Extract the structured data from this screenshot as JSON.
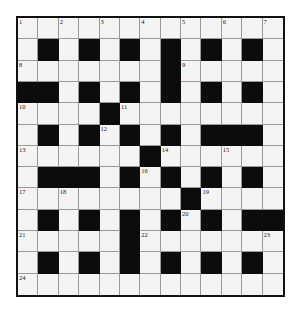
{
  "puzzle": {
    "rows": 13,
    "cols": 13,
    "colors": {
      "white_cell": "#f4f4f4",
      "black_cell": "#0c0c0c",
      "border": "#111111",
      "gridline": "#9a9a9a"
    },
    "black_cells": [
      [
        1,
        1
      ],
      [
        1,
        3
      ],
      [
        1,
        5
      ],
      [
        1,
        7
      ],
      [
        1,
        9
      ],
      [
        1,
        11
      ],
      [
        2,
        7
      ],
      [
        3,
        0
      ],
      [
        3,
        1
      ],
      [
        3,
        3
      ],
      [
        3,
        5
      ],
      [
        3,
        7
      ],
      [
        3,
        9
      ],
      [
        3,
        11
      ],
      [
        4,
        4
      ],
      [
        5,
        1
      ],
      [
        5,
        3
      ],
      [
        5,
        5
      ],
      [
        5,
        7
      ],
      [
        5,
        9
      ],
      [
        5,
        10
      ],
      [
        5,
        11
      ],
      [
        6,
        6
      ],
      [
        7,
        1
      ],
      [
        7,
        2
      ],
      [
        7,
        3
      ],
      [
        7,
        5
      ],
      [
        7,
        7
      ],
      [
        7,
        9
      ],
      [
        7,
        11
      ],
      [
        8,
        8
      ],
      [
        9,
        1
      ],
      [
        9,
        3
      ],
      [
        9,
        5
      ],
      [
        9,
        7
      ],
      [
        9,
        9
      ],
      [
        9,
        11
      ],
      [
        9,
        12
      ],
      [
        10,
        5
      ],
      [
        11,
        1
      ],
      [
        11,
        3
      ],
      [
        11,
        5
      ],
      [
        11,
        7
      ],
      [
        11,
        9
      ],
      [
        11,
        11
      ]
    ],
    "numbers": [
      {
        "row": 0,
        "col": 0,
        "n": "1"
      },
      {
        "row": 0,
        "col": 2,
        "n": "2"
      },
      {
        "row": 0,
        "col": 4,
        "n": "3"
      },
      {
        "row": 0,
        "col": 6,
        "n": "4"
      },
      {
        "row": 0,
        "col": 8,
        "n": "5"
      },
      {
        "row": 0,
        "col": 10,
        "n": "6"
      },
      {
        "row": 0,
        "col": 12,
        "n": "7"
      },
      {
        "row": 2,
        "col": 0,
        "n": "8"
      },
      {
        "row": 2,
        "col": 8,
        "n": "9"
      },
      {
        "row": 4,
        "col": 0,
        "n": "10"
      },
      {
        "row": 4,
        "col": 5,
        "n": "11"
      },
      {
        "row": 5,
        "col": 4,
        "n": "12"
      },
      {
        "row": 6,
        "col": 0,
        "n": "13"
      },
      {
        "row": 6,
        "col": 7,
        "n": "14"
      },
      {
        "row": 6,
        "col": 10,
        "n": "15"
      },
      {
        "row": 7,
        "col": 6,
        "n": "16"
      },
      {
        "row": 8,
        "col": 0,
        "n": "17"
      },
      {
        "row": 8,
        "col": 2,
        "n": "18"
      },
      {
        "row": 8,
        "col": 9,
        "n": "19"
      },
      {
        "row": 9,
        "col": 8,
        "n": "20"
      },
      {
        "row": 10,
        "col": 0,
        "n": "21"
      },
      {
        "row": 10,
        "col": 6,
        "n": "22"
      },
      {
        "row": 10,
        "col": 12,
        "n": "23"
      },
      {
        "row": 12,
        "col": 0,
        "n": "24"
      }
    ]
  }
}
